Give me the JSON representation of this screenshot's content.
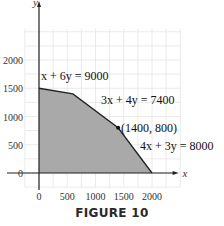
{
  "figure": {
    "caption": "FIGURE 10"
  },
  "chart_data": {
    "type": "area",
    "title": "",
    "xlabel": "x",
    "ylabel": "y",
    "xlim": [
      -100,
      2550
    ],
    "ylim": [
      -250,
      2600
    ],
    "grid": true,
    "grid_step": 250,
    "x_ticks": [
      0,
      500,
      1000,
      1500,
      2000
    ],
    "x_tick_labels": [
      "0",
      "500",
      "1000",
      "1500",
      "2000"
    ],
    "y_ticks": [
      0,
      500,
      1000,
      1500,
      2000
    ],
    "y_tick_labels": [
      "0",
      "500",
      "1000",
      "1500",
      "2000"
    ],
    "feasible_region": {
      "fill": "#a9a9a9",
      "vertices": [
        [
          0,
          0
        ],
        [
          0,
          1500
        ],
        [
          600,
          1400
        ],
        [
          1400,
          800
        ],
        [
          2000,
          0
        ]
      ]
    },
    "constraints": [
      {
        "label": "x + 6y = 9000"
      },
      {
        "label": "3x + 4y = 7400"
      },
      {
        "label": "4x + 3y = 8000"
      }
    ],
    "annotations": [
      {
        "point": [
          1400,
          800
        ],
        "label": "(1400, 800)"
      }
    ]
  }
}
